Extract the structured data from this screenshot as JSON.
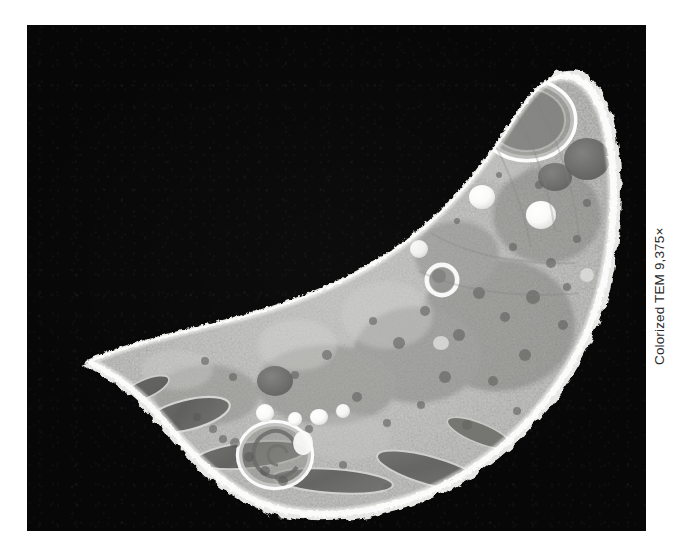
{
  "figure": {
    "kind": "electron-micrograph",
    "background_color": "#ffffff",
    "panel": {
      "background_color": "#070707",
      "left": 27,
      "top": 25,
      "width": 619,
      "height": 506
    },
    "caption": {
      "text": "Colorized TEM 9,375×",
      "technique": "Colorized TEM",
      "magnification": "9,375×",
      "rotation_degrees": -90,
      "color": "#2a2a2a",
      "position": "right-edge-vertical"
    },
    "specimen": {
      "description": "Crescent-shaped single cell in cross-section on black background",
      "shape": "crescent",
      "membrane_color": "#f2f2f0",
      "cytoplasm_color": "#9a9a98",
      "cytoplasm_color_dark": "#6e6e6c",
      "cytoplasm_color_light": "#c9c9c6",
      "vacuole_color": "#fbfbf9",
      "organelle_color": "#5e5e5c"
    },
    "organelles": [
      {
        "name": "ring-organelle-apical",
        "type": "ring-vacuole",
        "cx": 500,
        "cy": 95,
        "rx": 46,
        "ry": 38
      },
      {
        "name": "dense-body-upper",
        "type": "dense-body",
        "cx": 560,
        "cy": 135,
        "rx": 22,
        "ry": 20
      },
      {
        "name": "dense-body-upper-2",
        "type": "dense-body",
        "cx": 528,
        "cy": 150,
        "rx": 17,
        "ry": 14
      },
      {
        "name": "lipid-droplet-a",
        "type": "lipid-droplet",
        "cx": 455,
        "cy": 175,
        "rx": 12,
        "ry": 11
      },
      {
        "name": "lipid-droplet-b",
        "type": "lipid-droplet",
        "cx": 512,
        "cy": 190,
        "rx": 14,
        "ry": 13
      },
      {
        "name": "ring-vesicle-mid",
        "type": "ring-vacuole",
        "cx": 415,
        "cy": 255,
        "rx": 13,
        "ry": 13
      },
      {
        "name": "mitochondrion-left-1",
        "type": "mitochondrion",
        "cx": 160,
        "cy": 390,
        "rx": 42,
        "ry": 15
      },
      {
        "name": "mitochondrion-left-2",
        "type": "mitochondrion",
        "cx": 222,
        "cy": 430,
        "rx": 55,
        "ry": 13
      },
      {
        "name": "mitochondrion-left-3",
        "type": "mitochondrion",
        "cx": 300,
        "cy": 455,
        "rx": 60,
        "ry": 12
      },
      {
        "name": "mitochondrion-right",
        "type": "mitochondrion",
        "cx": 400,
        "cy": 448,
        "rx": 58,
        "ry": 14
      },
      {
        "name": "dense-body-mid",
        "type": "dense-body",
        "cx": 248,
        "cy": 357,
        "rx": 18,
        "ry": 15
      },
      {
        "name": "spiral-organelle-basal",
        "type": "spiral-vacuole",
        "cx": 248,
        "cy": 430,
        "rx": 34,
        "ry": 30
      },
      {
        "name": "vesicle-cluster",
        "type": "vesicle-cluster",
        "cx": 230,
        "cy": 400,
        "rx": 8,
        "ry": 8
      }
    ]
  }
}
